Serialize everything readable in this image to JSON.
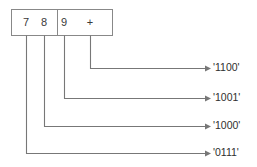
{
  "diagram": {
    "type": "bit-field-annotation-diagram",
    "box": {
      "x": 11,
      "y": 9,
      "width": 102,
      "height": 27,
      "divider_x": 57,
      "cells": [
        {
          "name": "left-cell",
          "chars": [
            {
              "text": "7",
              "x": 26
            },
            {
              "text": "8",
              "x": 44
            }
          ]
        },
        {
          "name": "right-cell",
          "chars": [
            {
              "text": "9",
              "x": 64
            },
            {
              "text": "+",
              "x": 90
            }
          ]
        }
      ]
    },
    "connectors": [
      {
        "name": "connector-1100",
        "source_char": "+",
        "drop_x": 90,
        "elbow_y": 68,
        "arrow_x": 208,
        "label": "'1100'",
        "label_x": 213,
        "label_y": 68
      },
      {
        "name": "connector-1001",
        "source_char": "9",
        "drop_x": 64,
        "elbow_y": 98,
        "arrow_x": 208,
        "label": "'1001'",
        "label_x": 213,
        "label_y": 98
      },
      {
        "name": "connector-1000",
        "source_char": "8",
        "drop_x": 44,
        "elbow_y": 126,
        "arrow_x": 208,
        "label": "'1000'",
        "label_x": 213,
        "label_y": 126
      },
      {
        "name": "connector-0111",
        "source_char": "7",
        "drop_x": 26,
        "elbow_y": 153,
        "arrow_x": 208,
        "label": "'0111'",
        "label_x": 213,
        "label_y": 153
      }
    ],
    "colors": {
      "background": "#ffffff",
      "box_border": "#888888",
      "connector_line": "#777777",
      "text": "#3a3a3a",
      "label_text": "#2e2e2e"
    }
  }
}
